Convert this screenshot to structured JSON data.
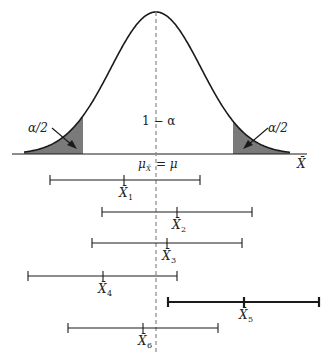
{
  "diagram": {
    "type": "confidence-interval-illustration",
    "curve": {
      "description": "normal sampling distribution of X-bar",
      "peak_x": 156,
      "baseline_y": 154,
      "peak_y": 12,
      "sigma_px": 45,
      "tail_left_cut_x": 83,
      "tail_right_cut_x": 233,
      "shade_color": "#7a7a7a",
      "line_color": "#1a1a1a"
    },
    "labels": {
      "left_tail": "α/2",
      "right_tail": "α/2",
      "center_area": "1 − α",
      "mean_mu": "μ",
      "mean_sub": "X̄",
      "mean_eq": "= μ",
      "axis_var": "X̄"
    },
    "intervals": [
      {
        "label": "X̄",
        "sub": "1",
        "left": 50,
        "center": 124,
        "right": 200,
        "y": 180,
        "bold": false
      },
      {
        "label": "X̄",
        "sub": "2",
        "left": 102,
        "center": 177,
        "right": 252,
        "y": 212,
        "bold": false
      },
      {
        "label": "X̄",
        "sub": "3",
        "left": 92,
        "center": 167,
        "right": 242,
        "y": 243,
        "bold": false
      },
      {
        "label": "X̄",
        "sub": "4",
        "left": 28,
        "center": 103,
        "right": 177,
        "y": 276,
        "bold": false
      },
      {
        "label": "X̄",
        "sub": "5",
        "left": 168,
        "center": 244,
        "right": 319,
        "y": 302,
        "bold": true
      },
      {
        "label": "X̄",
        "sub": "6",
        "left": 68,
        "center": 143,
        "right": 218,
        "y": 328,
        "bold": false
      }
    ],
    "dashed_line": {
      "x": 156,
      "y1": 12,
      "y2": 352,
      "color": "#888888"
    }
  }
}
